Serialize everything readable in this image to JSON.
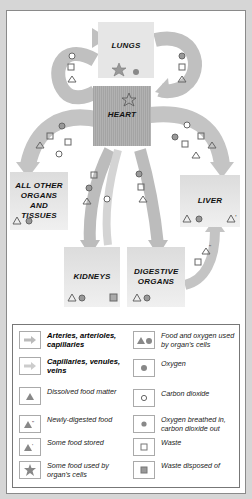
{
  "diagram": {
    "organs": {
      "lungs": "LUNGS",
      "heart": "HEART",
      "other": "ALL OTHER ORGANS AND TISSUES",
      "liver": "LIVER",
      "kidneys": "KIDNEYS",
      "digestive": "DIGESTIVE ORGANS"
    },
    "colors": {
      "arrow": "#b8b8b8",
      "heart": "#a8a8a8",
      "organ_box": "#e4e4e4",
      "symbol": "#8a8a8a",
      "frame": "#d6d6d6"
    }
  },
  "legend": {
    "items": [
      {
        "symbol": "arrow-dark",
        "label": "Arteries, arterioles, capillaries"
      },
      {
        "symbol": "arrow-light",
        "label": "Capillaries, venules, veins"
      },
      {
        "symbol": "triangle",
        "label": "Dissolved food matter"
      },
      {
        "symbol": "triangle-double-prime",
        "label": "Newly-digested food"
      },
      {
        "symbol": "triangle-prime",
        "label": "Some food stored"
      },
      {
        "symbol": "star",
        "label": "Some food used by organ's cells"
      },
      {
        "symbol": "triangle-circle",
        "label": "Food and oxygen used by organ's cells"
      },
      {
        "symbol": "filled-circle",
        "label": "Oxygen"
      },
      {
        "symbol": "open-circle",
        "label": "Carbon dioxide"
      },
      {
        "symbol": "filled-circle-small",
        "label": "Oxygen breathed in, carbon dioxide out"
      },
      {
        "symbol": "open-square",
        "label": "Waste"
      },
      {
        "symbol": "filled-square",
        "label": "Waste disposed of"
      }
    ]
  }
}
